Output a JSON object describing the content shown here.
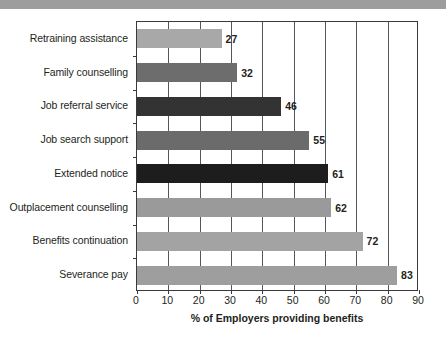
{
  "figure": {
    "top_band_color": "#9d9d9d",
    "background": "#ffffff"
  },
  "chart_data": {
    "type": "bar",
    "orientation": "horizontal",
    "title": "",
    "subtitle": "",
    "xlabel": "% of Employers providing benefits",
    "ylabel": "",
    "xlim": [
      0,
      90
    ],
    "xticks": [
      0,
      10,
      20,
      30,
      40,
      50,
      60,
      70,
      80,
      90
    ],
    "xtick_labels": [
      "0",
      "10",
      "20",
      "30",
      "40",
      "50",
      "60",
      "70",
      "80",
      "90"
    ],
    "grid": "vertical",
    "legend": "none",
    "categories": [
      "Retraining assistance",
      "Family counselling",
      "Job referral service",
      "Job search support",
      "Extended notice",
      "Outplacement counselling",
      "Benefits continuation",
      "Severance pay"
    ],
    "values": [
      27,
      32,
      46,
      55,
      61,
      62,
      72,
      83
    ],
    "value_labels": [
      "27",
      "32",
      "46",
      "55",
      "61",
      "62",
      "72",
      "83"
    ],
    "bar_colors": [
      "#a8a8a8",
      "#6d6d6d",
      "#333333",
      "#6b6b6b",
      "#1d1d1d",
      "#9a9a9a",
      "#a3a3a3",
      "#9e9e9e"
    ],
    "axis_color": "#3a3a3a",
    "gridline_color": "#55585a"
  }
}
